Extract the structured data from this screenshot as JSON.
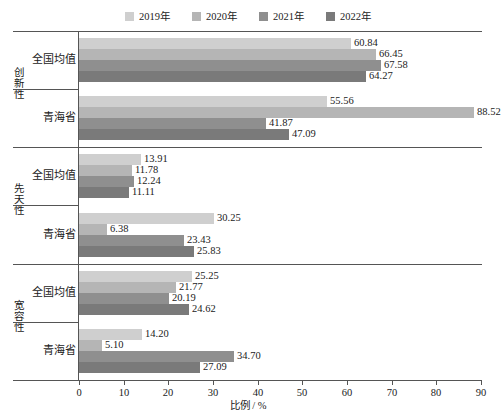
{
  "chart_data": {
    "type": "bar",
    "orientation": "horizontal",
    "title": "",
    "xlabel": "比例 / %",
    "ylabel": "",
    "xlim": [
      0,
      90
    ],
    "xticks": [
      0,
      10,
      20,
      30,
      40,
      50,
      60,
      70,
      80,
      90
    ],
    "grid": false,
    "legend_position": "top-center",
    "series": [
      {
        "name": "2019年",
        "color": "#cfcfcf"
      },
      {
        "name": "2020年",
        "color": "#b5b5b5"
      },
      {
        "name": "2021年",
        "color": "#8f8f8f"
      },
      {
        "name": "2022年",
        "color": "#7a7a7a"
      }
    ],
    "groups": [
      {
        "group_label": "创新性",
        "categories": [
          {
            "label": "全国均值",
            "values": [
              60.84,
              66.45,
              67.58,
              64.27
            ]
          },
          {
            "label": "青海省",
            "values": [
              55.56,
              88.52,
              41.87,
              47.09
            ]
          }
        ]
      },
      {
        "group_label": "先天性",
        "categories": [
          {
            "label": "全国均值",
            "values": [
              13.91,
              11.78,
              12.24,
              11.11
            ]
          },
          {
            "label": "青海省",
            "values": [
              30.25,
              6.38,
              23.43,
              25.83
            ]
          }
        ]
      },
      {
        "group_label": "宽容性",
        "categories": [
          {
            "label": "全国均值",
            "values": [
              25.25,
              21.77,
              20.19,
              24.62
            ]
          },
          {
            "label": "青海省",
            "values": [
              14.2,
              5.1,
              34.7,
              27.09
            ]
          }
        ]
      }
    ],
    "value_labels": [
      "60.84",
      "66.45",
      "67.58",
      "64.27",
      "55.56",
      "88.52",
      "41.87",
      "47.09",
      "13.91",
      "11.78",
      "12.24",
      "11.11",
      "30.25",
      "6.38",
      "23.43",
      "25.83",
      "25.25",
      "21.77",
      "20.19",
      "24.62",
      "14.20",
      "5.10",
      "34.70",
      "27.09"
    ]
  },
  "legend": {
    "items": [
      {
        "label": "2019年",
        "color": "#cfcfcf"
      },
      {
        "label": "2020年",
        "color": "#b5b5b5"
      },
      {
        "label": "2021年",
        "color": "#8f8f8f"
      },
      {
        "label": "2022年",
        "color": "#7a7a7a"
      }
    ]
  },
  "axis": {
    "x_title": "比例 / %",
    "x_tick_labels": [
      "0",
      "10",
      "20",
      "30",
      "40",
      "50",
      "60",
      "70",
      "80",
      "90"
    ]
  }
}
